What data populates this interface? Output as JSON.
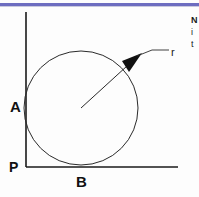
{
  "page": {
    "background_color": "#fdfdfd",
    "width": 199,
    "height": 197
  },
  "top_rule": {
    "color": "#6d6dc0",
    "shadow_color": "#c9c9de"
  },
  "figure": {
    "type": "geometry-diagram",
    "stroke_color": "#1a1a1a",
    "axis": {
      "origin_label": "P",
      "vertical_label": "A",
      "horizontal_label": "B",
      "vertical_x": 26,
      "vertical_top_y": 12,
      "horizontal_y": 167,
      "horizontal_right_x": 178
    },
    "circle": {
      "center_x": 81,
      "center_y": 108,
      "radius": 57,
      "fill": "none",
      "stroke_width": 1
    },
    "radius_line": {
      "from_x": 81,
      "from_y": 108,
      "to_x": 129,
      "to_y": 64,
      "label": "r",
      "arrow": "filled-triangle-pointing-to-center"
    },
    "leader_line": {
      "from_x": 131,
      "from_y": 59,
      "to_x": 169,
      "to_y": 52
    },
    "labels": {
      "origin": "P",
      "y_axis_point": "A",
      "x_axis_point": "B",
      "radius": "r"
    }
  },
  "side_text": {
    "lines": [
      "N",
      "i",
      "t"
    ]
  }
}
